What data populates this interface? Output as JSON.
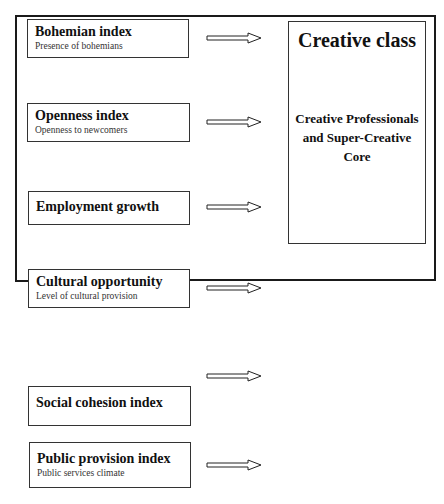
{
  "diagram": {
    "inputs": [
      {
        "title": "Bohemian index",
        "subtitle": "Presence of bohemians"
      },
      {
        "title": "Openness index",
        "subtitle": "Openness to newcomers"
      },
      {
        "title": "Employment growth",
        "subtitle": ""
      },
      {
        "title": "Cultural opportunity",
        "subtitle": "Level of cultural provision"
      },
      {
        "title": "Social cohesion index",
        "subtitle": ""
      },
      {
        "title": "Public provision index",
        "subtitle": "Public services climate"
      }
    ],
    "output": {
      "title": "Creative class",
      "body": "Creative Professionals and Super-Creative Core"
    },
    "arrow_style": "hollow-right-arrow",
    "line_color": "#1a1a1a"
  },
  "caption": {
    "text": ""
  }
}
